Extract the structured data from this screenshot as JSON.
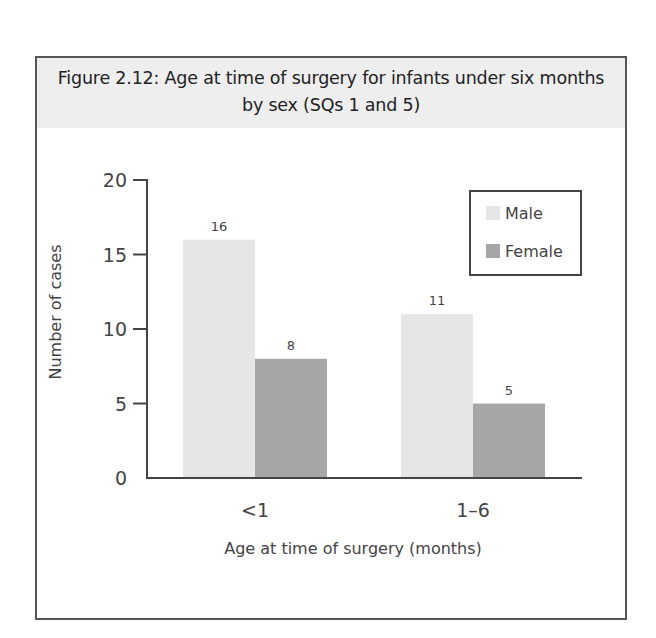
{
  "figure": {
    "title_line1": "Figure 2.12: Age at time of surgery for infants under six months",
    "title_line2": "by sex (SQs 1 and 5)"
  },
  "chart_data": {
    "type": "bar",
    "title": "Figure 2.12: Age at time of surgery for infants under six months by sex (SQs 1 and 5)",
    "xlabel": "Age at time of surgery (months)",
    "ylabel": "Number of cases",
    "categories": [
      "<1",
      "1–6"
    ],
    "series": [
      {
        "name": "Male",
        "values": [
          16,
          11
        ],
        "color": "#e6e6e6"
      },
      {
        "name": "Female",
        "values": [
          8,
          5
        ],
        "color": "#a6a6a6"
      }
    ],
    "ylim": [
      0,
      20
    ],
    "yticks": [
      0,
      5,
      10,
      15,
      20
    ],
    "data_labels": true,
    "grid": false,
    "legend_position": "upper-right-inside",
    "legend": [
      "Male",
      "Female"
    ]
  },
  "colors": {
    "frame": "#555555",
    "title_band": "#eeeeee",
    "axis": "#444444",
    "male": "#e6e6e6",
    "female": "#a6a6a6"
  }
}
